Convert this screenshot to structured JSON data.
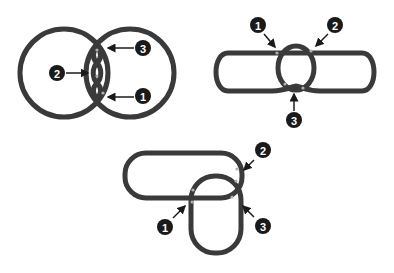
{
  "colors": {
    "background": "#ffffff",
    "loop_stroke": "#3a3a3a",
    "loop_inner": "#555555",
    "crossing_highlight": "#b0b0b0",
    "badge_fill": "#1a1a1a",
    "badge_text": "#ffffff",
    "arrow": "#1a1a1a"
  },
  "figures": [
    {
      "id": "figure-1",
      "description": "Two overlapping circles with a twisted crossing region",
      "labels": [
        {
          "number": "3",
          "x": 143,
          "y": 48
        },
        {
          "number": "2",
          "x": 57,
          "y": 73
        },
        {
          "number": "1",
          "x": 143,
          "y": 96
        }
      ]
    },
    {
      "id": "figure-2",
      "description": "Elongated stadium loop with an oval loop crossing through the middle",
      "labels": [
        {
          "number": "1",
          "x": 258,
          "y": 25
        },
        {
          "number": "2",
          "x": 335,
          "y": 25
        },
        {
          "number": "3",
          "x": 294,
          "y": 120
        }
      ]
    },
    {
      "id": "figure-3",
      "description": "Horizontal rounded rectangle loop overlapping a vertical rounded rectangle loop",
      "labels": [
        {
          "number": "1",
          "x": 165,
          "y": 227
        },
        {
          "number": "2",
          "x": 263,
          "y": 150
        },
        {
          "number": "3",
          "x": 263,
          "y": 226
        }
      ]
    }
  ]
}
